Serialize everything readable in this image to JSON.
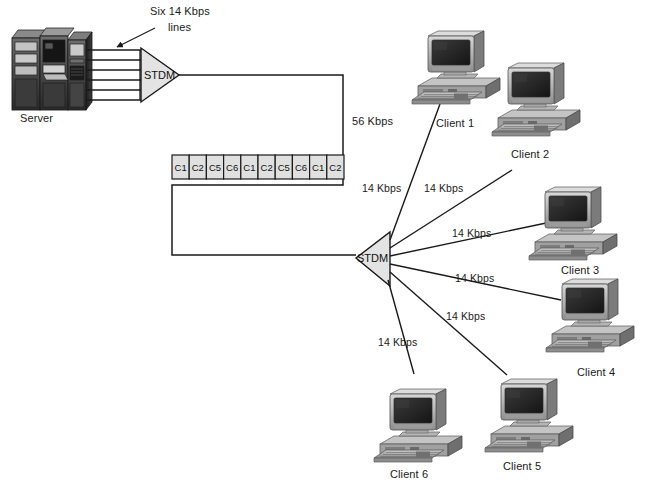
{
  "diagram": {
    "background_color": "#ffffff",
    "line_color": "#1a1a1a"
  },
  "server": {
    "label": "Server",
    "icon": "server-cabinet-icon"
  },
  "annotations": {
    "six_lines_line1": "Six 14 Kbps",
    "six_lines_line2": "lines",
    "trunk_rate": "56 Kbps"
  },
  "multiplexers": [
    {
      "name": "stdm-left",
      "label": "STDM",
      "orientation": "points-right"
    },
    {
      "name": "stdm-right",
      "label": "STDM",
      "orientation": "points-left"
    }
  ],
  "frame": {
    "name": "multiplexed-frame",
    "cells": [
      "C1",
      "C2",
      "C5",
      "C6",
      "C1",
      "C2",
      "C5",
      "C6",
      "C1",
      "C2"
    ],
    "cell_fill": "#e0e0e0"
  },
  "links": [
    {
      "name": "link-client-1",
      "label": "14 Kbps"
    },
    {
      "name": "link-client-2",
      "label": "14 Kbps"
    },
    {
      "name": "link-client-3",
      "label": "14 Kbps"
    },
    {
      "name": "link-client-4",
      "label": "14 Kbps"
    },
    {
      "name": "link-client-5",
      "label": "14 Kbps"
    },
    {
      "name": "link-client-6",
      "label": "14 Kbps"
    }
  ],
  "clients": [
    {
      "name": "client-1",
      "label": "Client 1"
    },
    {
      "name": "client-2",
      "label": "Client 2"
    },
    {
      "name": "client-3",
      "label": "Client 3"
    },
    {
      "name": "client-4",
      "label": "Client 4"
    },
    {
      "name": "client-5",
      "label": "Client 5"
    },
    {
      "name": "client-6",
      "label": "Client 6"
    }
  ]
}
